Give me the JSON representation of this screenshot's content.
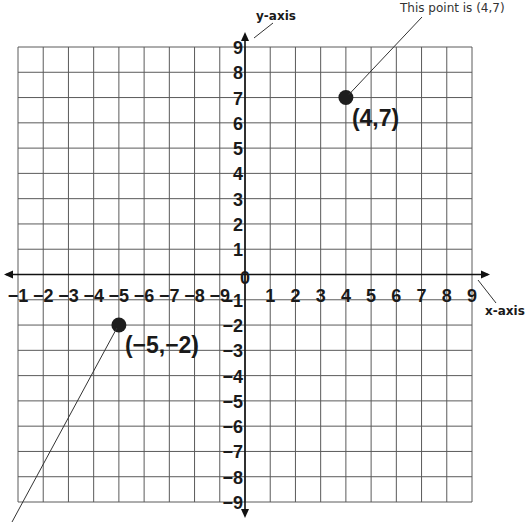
{
  "chart_data": {
    "type": "scatter",
    "title": "",
    "xlabel": "x-axis",
    "ylabel": "y-axis",
    "xlim": [
      -9,
      9
    ],
    "ylim": [
      -9,
      9
    ],
    "grid": true,
    "x_tick_labels_left": [
      "−1",
      "−2",
      "−3",
      "−4",
      "−5",
      "−6",
      "−7",
      "−8",
      "−9"
    ],
    "x_tick_labels_right": [
      "1",
      "2",
      "3",
      "4",
      "5",
      "6",
      "7",
      "8",
      "9"
    ],
    "origin_label": "0",
    "y_tick_labels_top": [
      "9",
      "8",
      "7",
      "6",
      "5",
      "4",
      "3",
      "2",
      "1"
    ],
    "y_tick_labels_bottom": [
      "−1",
      "−2",
      "−3",
      "−4",
      "−5",
      "−6",
      "−7",
      "−8",
      "−9"
    ],
    "points": [
      {
        "x": 4,
        "y": 7,
        "label": "(4,7)"
      },
      {
        "x": -5,
        "y": -2,
        "label": "(−5,−2)"
      }
    ],
    "annotations": [
      {
        "text": "This point is (4,7)",
        "target": [
          4,
          7
        ]
      }
    ]
  },
  "colors": {
    "grid": "#5a5a5a",
    "axis": "#111111",
    "point": "#1e1e1e",
    "text": "#1a1a1a"
  }
}
